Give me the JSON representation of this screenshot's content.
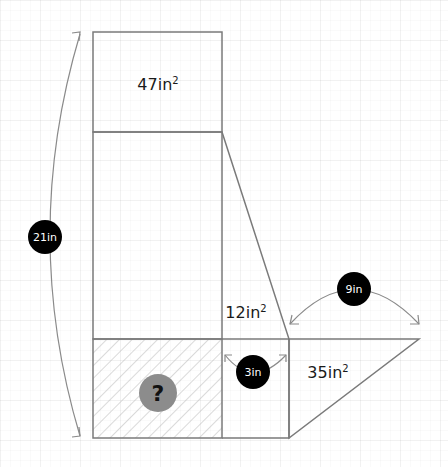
{
  "diagram": {
    "colors": {
      "line": "#7a7a7a",
      "badge": "#000000",
      "badge_text": "#ffffff",
      "unknown_badge": "#8c8c8c",
      "hatch": "#b5b5b5"
    },
    "areas": {
      "top_rect": {
        "value": "47in",
        "sup": "2"
      },
      "trapezoid": {
        "value": "12in",
        "sup": "2"
      },
      "triangle": {
        "value": "35in",
        "sup": "2"
      }
    },
    "lengths": {
      "total_height": "21in",
      "triangle_base": "9in",
      "middle_width": "3in"
    },
    "unknown": {
      "symbol": "?"
    }
  }
}
